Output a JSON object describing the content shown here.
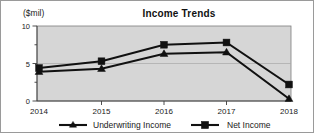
{
  "figure": {
    "unit_label": "($mil)",
    "title": "Income Trends"
  },
  "legend": {
    "position": "below-axis",
    "entries": [
      {
        "label": "Underwriting Income",
        "marker": "triangle-marker-icon"
      },
      {
        "label": "Net Income",
        "marker": "square-marker-icon"
      }
    ]
  },
  "axes": {
    "y_ticks": [
      "0",
      "5",
      "10"
    ],
    "x_ticks": [
      "2014",
      "2015",
      "2016",
      "2017",
      "2018"
    ]
  },
  "colors": {
    "series": "#111111",
    "plot_background": "#d6d6d6",
    "gridline": "#a8a8a8",
    "frame": "#7d7d7d",
    "page_border": "#9a9a9a",
    "text": "#1a1a1a"
  },
  "chart_data": {
    "type": "line",
    "title": "Income Trends",
    "xlabel": "",
    "ylabel": "($mil)",
    "ylim": [
      0,
      10
    ],
    "yticks": [
      0,
      5,
      10
    ],
    "yminorticks": [
      2.5,
      7.5
    ],
    "grid": true,
    "legend_position": "bottom",
    "categories": [
      "2014",
      "2015",
      "2016",
      "2017",
      "2018"
    ],
    "series": [
      {
        "name": "Underwriting Income",
        "marker": "triangle",
        "values": [
          3.9,
          4.3,
          6.3,
          6.5,
          0.3
        ]
      },
      {
        "name": "Net Income",
        "marker": "square",
        "values": [
          4.4,
          5.3,
          7.5,
          7.8,
          2.2
        ]
      }
    ]
  }
}
